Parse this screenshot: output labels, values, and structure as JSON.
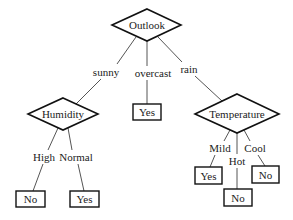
{
  "diagram": {
    "type": "decision-tree",
    "root": {
      "label": "Outlook",
      "branches": [
        {
          "edge_label": "sunny",
          "node": {
            "label": "Humidity",
            "branches": [
              {
                "edge_label": "High",
                "leaf": "No"
              },
              {
                "edge_label": "Normal",
                "leaf": "Yes"
              }
            ]
          }
        },
        {
          "edge_label": "overcast",
          "leaf": "Yes"
        },
        {
          "edge_label": "rain",
          "node": {
            "label": "Temperature",
            "branches": [
              {
                "edge_label": "Mild",
                "leaf": "Yes"
              },
              {
                "edge_label": "Hot",
                "leaf": "No"
              },
              {
                "edge_label": "Cool",
                "leaf": "No"
              }
            ]
          }
        }
      ]
    }
  },
  "nodes": {
    "outlook": "Outlook",
    "humidity": "Humidity",
    "temperature": "Temperature"
  },
  "edges": {
    "sunny": "sunny",
    "overcast": "overcast",
    "rain": "rain",
    "high": "High",
    "normal": "Normal",
    "mild": "Mild",
    "hot": "Hot",
    "cool": "Cool"
  },
  "leaves": {
    "humidity_high": "No",
    "humidity_normal": "Yes",
    "overcast": "Yes",
    "temperature_mild": "Yes",
    "temperature_hot": "No",
    "temperature_cool": "No"
  }
}
